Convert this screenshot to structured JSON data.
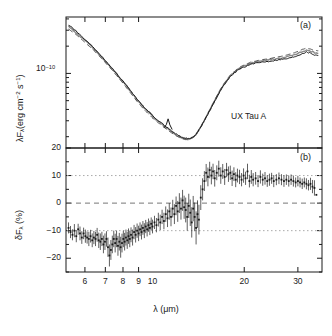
{
  "figure": {
    "panels": [
      {
        "tag": "(a)",
        "annotation": "UX Tau A",
        "ylabel_parts": {
          "lam": "λ",
          "F": "F",
          "sub": "λ",
          "rest": "(erg cm",
          "sup1": "−2",
          "mid": " s",
          "sup2": "−1",
          "close": ")"
        },
        "ytick_labels": [
          "10"
        ],
        "ytick_exponent": "−10"
      },
      {
        "tag": "(b)",
        "ylabel_parts": {
          "delta": "δF",
          "sub": "λ",
          "rest": " (%)"
        },
        "ytick_labels": [
          "20",
          "10",
          "0",
          "−10",
          "−20"
        ]
      }
    ],
    "xlabel_parts": {
      "lam": "λ",
      "rest": " (μm)"
    },
    "xtick_labels": [
      "6",
      "7",
      "8",
      "9",
      "10",
      "20",
      "30"
    ],
    "colors": {
      "frame": "#1a1a1a",
      "curve_solid": "#1a1a1a",
      "curve_dashed": "#555555",
      "curve_gray": "#8a8a8a",
      "refline_dashed": "#777777",
      "refline_dotted": "#aaaaaa",
      "marker": "#1a1a1a"
    }
  },
  "chart_data": [
    {
      "type": "line",
      "panel": "a",
      "title": "",
      "subtitle": "UX Tau A",
      "xlabel": "λ (μm)",
      "ylabel": "λFλ (erg cm⁻² s⁻¹)",
      "xscale": "log",
      "yscale": "log",
      "xlim": [
        5.2,
        36.0
      ],
      "ylim": [
        1.5e-11,
        4.2e-10
      ],
      "xticks": [
        6,
        7,
        8,
        9,
        10,
        20,
        30
      ],
      "yticks": [
        1e-10
      ],
      "ytick_labels": [
        "10⁻¹⁰"
      ],
      "grid": false,
      "legend": null,
      "annotations": [
        {
          "text": "UX Tau A",
          "x": 20.0,
          "y": 2.4e-11
        },
        {
          "text": "(a)",
          "x": 33.0,
          "y": 3.6e-10
        }
      ],
      "series": [
        {
          "name": "observed spectrum",
          "style": "solid",
          "color": "#1a1a1a",
          "x": [
            5.3,
            5.6,
            5.9,
            6.2,
            6.5,
            6.8,
            7.1,
            7.4,
            7.7,
            8.0,
            8.3,
            8.6,
            8.9,
            9.2,
            9.5,
            9.8,
            10.1,
            10.4,
            10.7,
            11.0,
            11.3,
            11.6,
            11.9,
            12.2,
            12.5,
            12.8,
            13.1,
            13.4,
            13.7,
            14.0,
            14.4,
            14.8,
            15.2,
            15.6,
            16.0,
            16.5,
            17.0,
            17.5,
            18.0,
            18.5,
            19.0,
            19.5,
            20.0,
            21.0,
            22.0,
            23.0,
            24.0,
            25.0,
            26.0,
            27.0,
            28.0,
            29.0,
            30.0,
            31.0,
            32.0,
            33.0,
            34.0,
            35.0
          ],
          "y": [
            3.45e-10,
            2.95e-10,
            2.5e-10,
            2.15e-10,
            1.82e-10,
            1.55e-10,
            1.31e-10,
            1.12e-10,
            9.55e-11,
            8.2e-11,
            7.05e-11,
            6.05e-11,
            5.2e-11,
            4.55e-11,
            4.05e-11,
            3.7e-11,
            3.3e-11,
            3.05e-11,
            2.85e-11,
            2.62e-11,
            2.45e-11,
            2.3e-11,
            2.16e-11,
            2.05e-11,
            1.96e-11,
            1.92e-11,
            1.9e-11,
            1.93e-11,
            2.02e-11,
            2.2e-11,
            2.55e-11,
            3e-11,
            3.55e-11,
            4.2e-11,
            4.95e-11,
            6e-11,
            7.1e-11,
            8.2e-11,
            9.2e-11,
            1e-10,
            1.08e-10,
            1.14e-10,
            1.18e-10,
            1.26e-10,
            1.3e-10,
            1.34e-10,
            1.36e-10,
            1.39e-10,
            1.42e-10,
            1.44e-10,
            1.47e-10,
            1.52e-10,
            1.58e-10,
            1.66e-10,
            1.72e-10,
            1.68e-10,
            1.6e-10,
            1.58e-10
          ]
        },
        {
          "name": "model spectrum",
          "style": "dashed",
          "color": "#555555",
          "x": [
            5.3,
            5.6,
            5.9,
            6.2,
            6.5,
            6.8,
            7.1,
            7.4,
            7.7,
            8.0,
            8.3,
            8.6,
            8.9,
            9.2,
            9.5,
            9.8,
            10.1,
            10.4,
            10.7,
            11.0,
            11.3,
            11.6,
            11.9,
            12.2,
            12.5,
            12.8,
            13.1,
            13.4,
            13.7,
            14.0,
            14.4,
            14.8,
            15.2,
            15.6,
            16.0,
            16.5,
            17.0,
            17.5,
            18.0,
            18.5,
            19.0,
            19.5,
            20.0,
            21.0,
            22.0,
            23.0,
            24.0,
            25.0,
            26.0,
            27.0,
            28.0,
            29.0,
            30.0,
            31.0,
            32.0,
            33.0,
            34.0,
            35.0
          ],
          "y": [
            3.1e-10,
            2.7e-10,
            2.32e-10,
            2e-10,
            1.72e-10,
            1.47e-10,
            1.25e-10,
            1.07e-10,
            9.1e-11,
            7.8e-11,
            6.65e-11,
            5.7e-11,
            4.9e-11,
            4.3e-11,
            3.82e-11,
            3.45e-11,
            3.12e-11,
            2.88e-11,
            2.68e-11,
            2.48e-11,
            2.32e-11,
            2.18e-11,
            2.06e-11,
            1.97e-11,
            1.9e-11,
            1.86e-11,
            1.85e-11,
            1.9e-11,
            2e-11,
            2.2e-11,
            2.58e-11,
            3.05e-11,
            3.62e-11,
            4.3e-11,
            5.1e-11,
            6.2e-11,
            7.35e-11,
            8.5e-11,
            9.55e-11,
            1.04e-10,
            1.12e-10,
            1.19e-10,
            1.24e-10,
            1.33e-10,
            1.38e-10,
            1.42e-10,
            1.45e-10,
            1.49e-10,
            1.53e-10,
            1.57e-10,
            1.62e-10,
            1.68e-10,
            1.75e-10,
            1.84e-10,
            1.9e-10,
            1.86e-10,
            1.8e-10,
            1.78e-10
          ]
        },
        {
          "name": "comparison spectrum",
          "style": "solid-gray",
          "color": "#8a8a8a",
          "x": [
            5.3,
            5.6,
            5.9,
            6.2,
            6.5,
            6.8,
            7.1,
            7.4,
            7.7,
            8.0,
            8.3,
            8.6,
            8.9,
            9.2,
            9.5,
            9.8,
            10.1,
            10.4,
            10.7,
            11.0,
            11.3,
            11.6,
            11.9,
            12.2,
            12.5,
            12.8,
            13.1,
            13.4,
            13.7,
            14.0,
            14.4,
            14.8,
            15.2,
            15.6,
            16.0,
            16.5,
            17.0,
            17.5,
            18.0,
            18.5,
            19.0,
            19.5,
            20.0,
            21.0,
            22.0,
            23.0,
            24.0,
            25.0,
            26.0,
            27.0,
            28.0,
            29.0,
            30.0,
            31.0,
            32.0,
            33.0,
            34.0,
            35.0
          ],
          "y": [
            3.3e-10,
            2.85e-10,
            2.44e-10,
            2.1e-10,
            1.79e-10,
            1.53e-10,
            1.3e-10,
            1.11e-10,
            9.48e-11,
            8.12e-11,
            6.95e-11,
            5.96e-11,
            5.12e-11,
            4.48e-11,
            3.98e-11,
            3.62e-11,
            3.24e-11,
            2.99e-11,
            2.79e-11,
            2.57e-11,
            2.4e-11,
            2.26e-11,
            2.12e-11,
            2.02e-11,
            1.94e-11,
            1.9e-11,
            1.88e-11,
            1.92e-11,
            2.01e-11,
            2.19e-11,
            2.56e-11,
            3.02e-11,
            3.58e-11,
            4.24e-11,
            5e-11,
            6.08e-11,
            7.2e-11,
            8.32e-11,
            9.34e-11,
            1.02e-10,
            1.1e-10,
            1.16e-10,
            1.21e-10,
            1.29e-10,
            1.34e-10,
            1.38e-10,
            1.41e-10,
            1.44e-10,
            1.47e-10,
            1.5e-10,
            1.54e-10,
            1.6e-10,
            1.66e-10,
            1.74e-10,
            1.8e-10,
            1.76e-10,
            1.7e-10,
            1.67e-10
          ]
        }
      ]
    },
    {
      "type": "scatter",
      "panel": "b",
      "title": "",
      "xlabel": "λ (μm)",
      "ylabel": "δFλ (%)",
      "xscale": "log",
      "yscale": "linear",
      "xlim": [
        5.2,
        36.0
      ],
      "ylim": [
        -25,
        20
      ],
      "xticks": [
        6,
        7,
        8,
        9,
        10,
        20,
        30
      ],
      "yticks": [
        20,
        10,
        0,
        -10,
        -20
      ],
      "grid": false,
      "errorbars": true,
      "reference_lines": [
        {
          "y": 10,
          "style": "dotted"
        },
        {
          "y": 0,
          "style": "dashed"
        },
        {
          "y": -10,
          "style": "dotted"
        }
      ],
      "annotations": [
        {
          "text": "(b)",
          "x": 33.0,
          "y": 16.0
        }
      ],
      "x": [
        5.3,
        5.38,
        5.46,
        5.54,
        5.62,
        5.7,
        5.78,
        5.86,
        5.94,
        6.02,
        6.1,
        6.18,
        6.26,
        6.34,
        6.42,
        6.5,
        6.58,
        6.66,
        6.74,
        6.82,
        6.9,
        6.98,
        7.06,
        7.14,
        7.22,
        7.3,
        7.38,
        7.46,
        7.54,
        7.62,
        7.7,
        7.78,
        7.86,
        7.94,
        8.02,
        8.1,
        8.18,
        8.26,
        8.34,
        8.42,
        8.5,
        8.6,
        8.7,
        8.8,
        8.9,
        9.0,
        9.1,
        9.2,
        9.3,
        9.4,
        9.5,
        9.6,
        9.7,
        9.8,
        9.9,
        10.0,
        10.15,
        10.3,
        10.45,
        10.6,
        10.75,
        10.9,
        11.05,
        11.2,
        11.35,
        11.5,
        11.65,
        11.8,
        11.95,
        12.1,
        12.25,
        12.4,
        12.55,
        12.7,
        12.85,
        13.0,
        13.15,
        13.3,
        13.45,
        13.6,
        13.75,
        13.9,
        14.05,
        14.2,
        14.4,
        14.6,
        14.8,
        15.0,
        15.2,
        15.4,
        15.6,
        15.8,
        16.0,
        16.25,
        16.5,
        16.75,
        17.0,
        17.25,
        17.5,
        17.75,
        18.0,
        18.25,
        18.5,
        18.75,
        19.0,
        19.3,
        19.6,
        19.9,
        20.2,
        20.5,
        20.8,
        21.1,
        21.4,
        21.8,
        22.2,
        22.6,
        23.0,
        23.4,
        23.8,
        24.2,
        24.6,
        25.0,
        25.5,
        26.0,
        26.5,
        27.0,
        27.5,
        28.0,
        28.5,
        29.0,
        29.5,
        30.0,
        30.5,
        31.0,
        31.5,
        32.0,
        32.5,
        33.0,
        33.5,
        34.0,
        34.5
      ],
      "y": [
        -9.0,
        -10.5,
        -11.5,
        -10.0,
        -12.0,
        -9.5,
        -11.0,
        -12.5,
        -11.0,
        -12.0,
        -12.5,
        -13.0,
        -12.0,
        -13.5,
        -12.5,
        -13.0,
        -11.5,
        -13.5,
        -14.0,
        -13.0,
        -15.0,
        -14.0,
        -13.0,
        -16.0,
        -19.0,
        -17.0,
        -15.0,
        -13.0,
        -14.5,
        -13.0,
        -15.5,
        -14.0,
        -16.0,
        -14.5,
        -13.0,
        -14.0,
        -12.5,
        -13.5,
        -12.0,
        -13.0,
        -11.5,
        -12.5,
        -10.5,
        -11.5,
        -10.0,
        -11.0,
        -9.5,
        -10.5,
        -9.0,
        -10.0,
        -8.5,
        -9.5,
        -8.0,
        -9.0,
        -7.5,
        -8.5,
        -7.0,
        -8.0,
        -6.0,
        -7.0,
        -5.0,
        -6.5,
        -4.0,
        -5.5,
        -3.0,
        -5.0,
        -2.0,
        -4.0,
        -1.0,
        -3.0,
        0.0,
        -2.0,
        1.0,
        -1.5,
        -2.5,
        -5.0,
        -1.0,
        -3.5,
        -7.0,
        -2.0,
        -5.0,
        -9.0,
        -4.0,
        -6.0,
        2.0,
        5.0,
        8.0,
        11.0,
        9.5,
        12.0,
        10.0,
        11.5,
        9.0,
        11.0,
        12.5,
        10.0,
        11.5,
        9.5,
        12.0,
        10.5,
        11.0,
        9.0,
        10.5,
        8.5,
        10.0,
        9.5,
        8.5,
        10.0,
        9.0,
        11.5,
        8.0,
        9.5,
        8.5,
        9.0,
        8.0,
        9.5,
        8.5,
        9.0,
        8.0,
        8.5,
        9.0,
        8.0,
        8.5,
        9.0,
        8.5,
        8.0,
        8.5,
        8.0,
        8.5,
        8.0,
        7.5,
        8.0,
        7.5,
        7.0,
        7.5,
        7.0,
        6.5,
        7.0,
        6.0,
        5.5,
        3.0
      ],
      "yerr": [
        2.0,
        2.2,
        2.0,
        2.4,
        2.2,
        2.0,
        2.5,
        2.3,
        2.1,
        2.4,
        2.2,
        2.6,
        2.3,
        2.5,
        2.4,
        2.6,
        2.5,
        2.8,
        3.0,
        2.6,
        3.2,
        3.0,
        2.8,
        3.5,
        4.0,
        3.6,
        3.2,
        3.0,
        3.4,
        3.0,
        3.6,
        3.2,
        3.8,
        3.4,
        3.0,
        3.2,
        2.9,
        3.1,
        2.8,
        3.0,
        2.7,
        2.9,
        2.6,
        2.8,
        2.6,
        2.8,
        2.5,
        2.7,
        2.5,
        2.7,
        2.4,
        2.6,
        2.4,
        2.6,
        2.3,
        2.5,
        2.4,
        2.6,
        2.5,
        2.8,
        2.6,
        3.0,
        2.8,
        3.2,
        3.0,
        3.4,
        3.2,
        3.6,
        3.4,
        3.8,
        3.6,
        4.0,
        3.8,
        4.2,
        4.5,
        5.0,
        4.4,
        4.8,
        5.5,
        4.6,
        5.2,
        6.0,
        5.0,
        5.4,
        4.5,
        4.0,
        3.6,
        3.2,
        3.4,
        3.0,
        3.2,
        2.8,
        3.0,
        2.7,
        2.9,
        3.0,
        2.7,
        2.9,
        2.6,
        2.8,
        2.6,
        2.8,
        2.5,
        2.7,
        2.5,
        2.6,
        2.4,
        2.6,
        2.4,
        2.8,
        2.3,
        2.5,
        2.4,
        2.3,
        2.2,
        2.4,
        2.2,
        2.3,
        2.1,
        2.2,
        2.0,
        2.2,
        2.0,
        2.1,
        2.0,
        2.1,
        1.9,
        2.0,
        1.9,
        2.0,
        1.8,
        1.9,
        1.8,
        1.9,
        1.8,
        2.0,
        1.9,
        2.2,
        2.4,
        2.8
      ]
    }
  ]
}
